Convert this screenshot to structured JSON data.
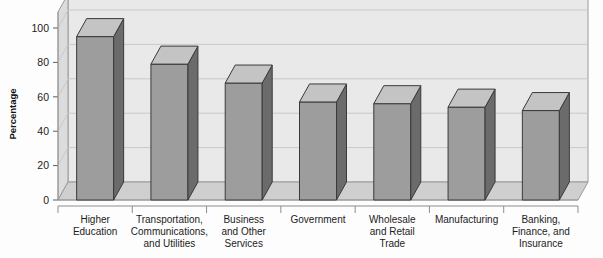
{
  "chart_data": {
    "type": "bar",
    "title": "",
    "subtitle": "",
    "xlabel": "",
    "ylabel": "Percentage",
    "categories": [
      "Higher\nEducation",
      "Transportation,\nCommunications,\nand Utilities",
      "Business\nand Other\nServices",
      "Government",
      "Wholesale\nand Retail\nTrade",
      "Manufacturing",
      "Banking,\nFinance, and\nInsurance"
    ],
    "category_lines": [
      [
        "Higher",
        "Education"
      ],
      [
        "Transportation,",
        "Communications,",
        "and Utilities"
      ],
      [
        "Business",
        "and Other",
        "Services"
      ],
      [
        "Government"
      ],
      [
        "Wholesale",
        "and Retail",
        "Trade"
      ],
      [
        "Manufacturing"
      ],
      [
        "Banking,",
        "Finance, and",
        "Insurance"
      ]
    ],
    "values": [
      95,
      79,
      68,
      57,
      56,
      54,
      52
    ],
    "ylim": [
      0,
      100
    ],
    "yticks": [
      0,
      20,
      40,
      60,
      80,
      100
    ],
    "ytick_labels": [
      "0",
      "20",
      "40",
      "60",
      "80",
      "100"
    ],
    "grid": true,
    "grid_axis": "y",
    "legend": false,
    "legend_position": "none",
    "style": "3d-bar",
    "colors": {
      "bar_front": "#9d9d9d",
      "bar_side": "#6b6b6b",
      "bar_top": "#c4c4c4",
      "bar_outline": "#3a3a3a",
      "back_wall": "#e9e9e9",
      "side_wall": "#dcdcdc",
      "floor": "#cfcfcf",
      "gridline": "#c9c9c9",
      "text": "#1c1c1c",
      "background": "#fdfdfd"
    }
  },
  "axes": {
    "y_axis_title": "Percentage"
  }
}
